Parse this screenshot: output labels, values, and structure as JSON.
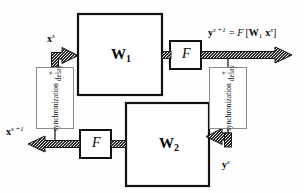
{
  "figure": {
    "background_color": "#fefefe",
    "line_color": "#111111",
    "box_border_color": "#111111",
    "sync_box_border_color": "#8a8a8a"
  },
  "blocks": {
    "w1": {
      "label": "W",
      "subscript": "1",
      "name": "weight-matrix-1"
    },
    "w2": {
      "label": "W",
      "subscript": "2",
      "name": "weight-matrix-2"
    },
    "f_top": {
      "label": "F",
      "name": "activation-function-top"
    },
    "f_bottom": {
      "label": "F",
      "name": "activation-function-bottom"
    }
  },
  "sync_blocks": {
    "left": {
      "line1": "synchronization",
      "plus": "+",
      "line2": "delay"
    },
    "right": {
      "line1": "synchronization",
      "plus": "+",
      "line2": "delay"
    }
  },
  "signals": {
    "x_s": {
      "base": "x",
      "sup": "s",
      "text": "x s"
    },
    "x_s_plus_1": {
      "base": "x",
      "sup": "s +1",
      "text": "x s+1"
    },
    "y_s": {
      "base": "y",
      "sup": "s",
      "text": "y s"
    },
    "y_s_plus_1": {
      "base": "y",
      "sup": "s +1",
      "text": "y s+1"
    }
  },
  "equation": {
    "lhs_base": "y",
    "lhs_sup": "s +1",
    "equals": "=",
    "func": "F",
    "open_bracket": "[",
    "w_base": "W",
    "w_sub": "1",
    "x_base": "x",
    "x_sup": "s",
    "close_bracket": "]",
    "full_text": "y s+1 = F [W1 x s]"
  }
}
